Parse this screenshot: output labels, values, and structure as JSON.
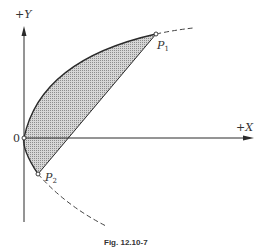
{
  "figure": {
    "caption": "Fig. 12.10-7",
    "axes": {
      "y_label": "+Y",
      "x_label": "+X",
      "origin_label": "0"
    },
    "points": [
      {
        "name": "P1",
        "letter": "P",
        "subscript": "1"
      },
      {
        "name": "P2",
        "letter": "P",
        "subscript": "2"
      }
    ],
    "curve": {
      "description": "Parabola opening to the right through origin; solid between P2 and P1, dashed beyond",
      "shaded_region": "Segment between parabola arc and chord P1-P2"
    },
    "colors": {
      "line": "#2a2a2a",
      "shade": "#b8b8b8",
      "background": "#ffffff"
    }
  }
}
